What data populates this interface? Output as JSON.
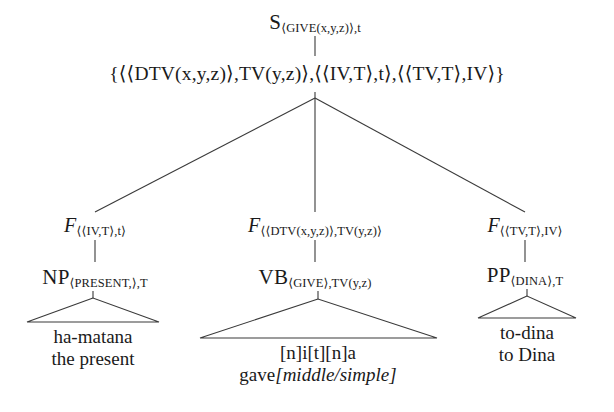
{
  "figure": {
    "type": "syntax-tree",
    "language_example": "Hebrew",
    "ink_color": "#1a1a1a",
    "background_color": "#ffffff"
  },
  "root": {
    "category": "S",
    "subscript": "⟨GIVE(x,y,z)⟩,t"
  },
  "feature_set": {
    "text": "{⟨⟨DTV(x,y,z)⟩,TV(y,z)⟩,⟨⟨IV,T⟩,t⟩,⟨⟨TV,T⟩,IV⟩}"
  },
  "functions": [
    {
      "label": "F",
      "subscript": "⟨⟨IV,T⟩,t⟩"
    },
    {
      "label": "F",
      "subscript": "⟨⟨DTV(x,y,z)⟩,TV(y,z)⟩"
    },
    {
      "label": "F",
      "subscript": "⟨⟨TV,T⟩,IV⟩"
    }
  ],
  "categories": [
    {
      "label": "NP",
      "subscript": "⟨PRESENT,⟩,T"
    },
    {
      "label": "VB",
      "subscript": "⟨GIVE⟩,TV(y,z)"
    },
    {
      "label": "PP",
      "subscript": "⟨DINA⟩,T"
    }
  ],
  "terminals": [
    {
      "surface": "ha-matana",
      "gloss": "the present"
    },
    {
      "surface": "[n]i[t][n]a",
      "gloss_prefix": "gave",
      "gloss_bracket": "[middle/simple]"
    },
    {
      "surface": "to-dina",
      "gloss": "to Dina"
    }
  ]
}
